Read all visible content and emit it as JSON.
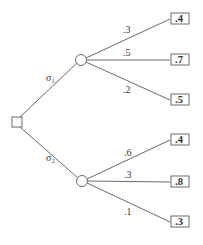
{
  "diagram": {
    "type": "decision-tree",
    "colors": {
      "line": "#6a6a6a",
      "text": "#333333",
      "background": "#ffffff"
    },
    "decision_node": {
      "shape": "square"
    },
    "branches": [
      {
        "action_label": "σ₁",
        "chance_node": {
          "shape": "circle"
        },
        "outcomes": [
          {
            "probability": ".3",
            "payoff": ".4"
          },
          {
            "probability": ".5",
            "payoff": ".7"
          },
          {
            "probability": ".2",
            "payoff": ".5"
          }
        ]
      },
      {
        "action_label": "σ₂",
        "chance_node": {
          "shape": "circle"
        },
        "outcomes": [
          {
            "probability": ".6",
            "payoff": ".4"
          },
          {
            "probability": ".3",
            "payoff": ".8"
          },
          {
            "probability": ".1",
            "payoff": ".3"
          }
        ]
      }
    ]
  }
}
